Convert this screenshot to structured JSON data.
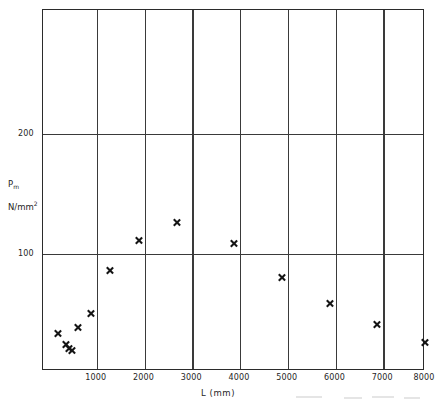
{
  "chart_data": {
    "type": "scatter",
    "title": "",
    "xlabel": "L (mm)",
    "ylabel": "P_m  N/mm2",
    "ylabel_parts": {
      "symbol": "P",
      "symbol_sub": "m",
      "units": "N/mm",
      "units_sup": "2"
    },
    "xlim": [
      0,
      8000
    ],
    "ylim": [
      0,
      301
    ],
    "xticks": [
      1000,
      2000,
      3000,
      4000,
      5000,
      6000,
      7000,
      8000
    ],
    "xtick_labels": [
      "1000",
      "2000",
      "3000",
      "4000",
      "5000",
      "6000",
      "7000",
      "8000"
    ],
    "yticks": [
      100,
      200
    ],
    "ytick_labels": [
      "100",
      "200"
    ],
    "grid": "major-xy",
    "legend": "none",
    "marker": "x",
    "series": [
      {
        "name": "measured",
        "points": [
          {
            "x": 320,
            "y": 31
          },
          {
            "x": 470,
            "y": 22
          },
          {
            "x": 540,
            "y": 19
          },
          {
            "x": 600,
            "y": 17
          },
          {
            "x": 740,
            "y": 36
          },
          {
            "x": 1000,
            "y": 48
          },
          {
            "x": 1400,
            "y": 84
          },
          {
            "x": 2000,
            "y": 109
          },
          {
            "x": 2800,
            "y": 124
          },
          {
            "x": 4000,
            "y": 106
          },
          {
            "x": 5000,
            "y": 78
          },
          {
            "x": 6000,
            "y": 56
          },
          {
            "x": 7000,
            "y": 39
          },
          {
            "x": 8000,
            "y": 24
          }
        ]
      }
    ]
  },
  "axes": {
    "x_axis_name": "L (mm)",
    "y_axis_name": "Pm N/mm2"
  }
}
